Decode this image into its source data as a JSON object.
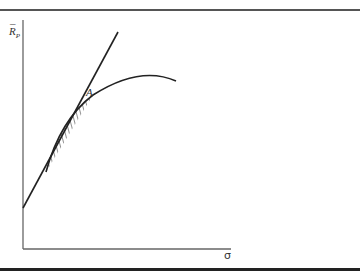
{
  "diagram": {
    "y_axis_label": "R",
    "y_axis_label_bar": "¯",
    "y_axis_label_subscript": "P",
    "x_axis_label": "σ",
    "point_label": "A",
    "elements": [
      {
        "type": "axis",
        "name": "y-axis"
      },
      {
        "type": "axis",
        "name": "x-axis"
      },
      {
        "type": "line",
        "name": "straight-line",
        "description": "straight line from y-axis intercept passing through point A"
      },
      {
        "type": "curve",
        "name": "concave-curve",
        "description": "concave frontier curve tangent/intersecting line at A"
      },
      {
        "type": "hatched-region",
        "name": "hatched-region",
        "description": "region between curve and line below point A"
      }
    ]
  }
}
